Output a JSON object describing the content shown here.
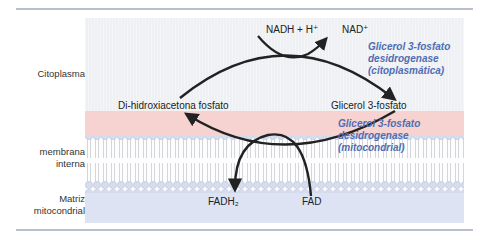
{
  "compartments": {
    "cytoplasm": "Citoplasma",
    "membrane_line1": "membrana",
    "membrane_line2": "interna",
    "matrix_line1": "Matriz",
    "matrix_line2": "mitocondrial"
  },
  "metabolites": {
    "nadh": "NADH + H⁺",
    "nad": "NAD⁺",
    "dhap": "Di-hidroxiacetona fosfato",
    "g3p": "Glicerol 3-fosfato",
    "fadh2": "FADH₂",
    "fad": "FAD"
  },
  "enzymes": {
    "cyto": [
      "Glicerol 3-fosfato",
      "desidrogenase",
      "(citoplasmática)"
    ],
    "mito": [
      "Glicerol 3-fosfato",
      "desidrogenase",
      "(mitocondrial)"
    ]
  },
  "colors": {
    "cytoplasm": "#eef0f4",
    "intermembrane": "#f6d3d1",
    "matrix": "#dde3f2",
    "enzyme_text": "#4f6db3",
    "arrow": "#222222",
    "lipid_head": "#d6ddef"
  }
}
